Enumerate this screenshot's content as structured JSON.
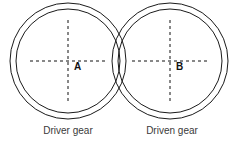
{
  "figure": {
    "background_color": "#ffffff",
    "line_color": "#1a1a1a",
    "dash_color": "#111111",
    "caption_color": "#3a3a3a",
    "width": 240,
    "height": 149
  },
  "gears": [
    {
      "id": "driver",
      "center_label": "A",
      "caption": "Driver gear",
      "center_x": 68,
      "center_y": 61,
      "outer_radius": 58,
      "inner_radius": 52,
      "label_x": 74,
      "label_y": 66,
      "caption_x": 68,
      "caption_y": 130
    },
    {
      "id": "driven",
      "center_label": "B",
      "caption": "Driven gear",
      "center_x": 170,
      "center_y": 61,
      "outer_radius": 58,
      "inner_radius": 52,
      "label_x": 176,
      "label_y": 66,
      "caption_x": 170,
      "caption_y": 130
    }
  ],
  "centerlines": {
    "style": "dashed",
    "dash_pattern": "3 3",
    "stroke_width": 1,
    "driver_horizontal": {
      "x1": 30,
      "y1": 61,
      "x2": 107,
      "y2": 61
    },
    "driver_vertical": {
      "x1": 68,
      "y1": 20,
      "x2": 68,
      "y2": 102
    },
    "driven_horizontal": {
      "x1": 132,
      "y1": 61,
      "x2": 209,
      "y2": 61
    },
    "driven_vertical": {
      "x1": 170,
      "y1": 20,
      "x2": 170,
      "y2": 102
    }
  }
}
